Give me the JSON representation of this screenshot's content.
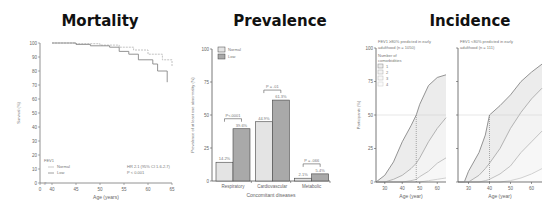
{
  "panels": {
    "mortality": {
      "title": "Mortality"
    },
    "prevalence": {
      "title": "Prevalence"
    },
    "incidence": {
      "title": "Incidence"
    }
  },
  "chart_data": [
    {
      "type": "line",
      "title": "Mortality",
      "xlabel": "Age (years)",
      "ylabel": "Survival (%)",
      "x_ticks": [
        "0",
        "40",
        "45",
        "50",
        "55",
        "60",
        "65"
      ],
      "y_ticks": [
        "0",
        "10",
        "20",
        "30",
        "40",
        "50",
        "60",
        "70",
        "80",
        "90",
        "100"
      ],
      "ylim": [
        0,
        100
      ],
      "xlim": [
        40,
        65
      ],
      "legend_title": "FEV1",
      "series": [
        {
          "name": "Normal",
          "x": [
            40,
            45,
            50,
            54,
            57,
            60,
            63,
            65
          ],
          "values": [
            100,
            99.5,
            98.5,
            97,
            95,
            92,
            88,
            83
          ]
        },
        {
          "name": "Low",
          "x": [
            40,
            45,
            48,
            52,
            54,
            56,
            58,
            61,
            62,
            64
          ],
          "values": [
            100,
            99,
            98,
            97,
            94,
            92,
            88,
            85,
            80,
            72
          ]
        }
      ],
      "annotations": [
        "HR 2.1 (95% CI 1.6-2.7)",
        "P < 0.001"
      ]
    },
    {
      "type": "bar",
      "title": "Prevalence",
      "xlabel": "Concomitant diseases",
      "ylabel": "Prevalence of at least one abnormality (%)",
      "categories": [
        "Respiratory",
        "Cardiovascular",
        "Metabolic"
      ],
      "series": [
        {
          "name": "Normal",
          "values": [
            14.2,
            44.9,
            2.1
          ],
          "color": "#e4e4e4"
        },
        {
          "name": "Low",
          "values": [
            39.6,
            61.3,
            5.4
          ],
          "color": "#a9a9a9"
        }
      ],
      "value_labels": {
        "Normal": [
          "14.2%",
          "44.9%",
          "2.1%"
        ],
        "Low": [
          "39.6%",
          "61.3%",
          "5.4%"
        ]
      },
      "p_values": [
        "P<.0001",
        "P = .01",
        "P = .066"
      ],
      "y_ticks": [
        "0",
        "25",
        "50",
        "75",
        "100"
      ],
      "ylim": [
        0,
        100
      ],
      "legend_position": "top-left"
    },
    {
      "type": "area",
      "title": "FEV1 ≥80% predicted in early adulthood (n = 1050)",
      "xlabel": "Age (year)",
      "ylabel": "Participants (%)",
      "x_ticks": [
        "30",
        "40",
        "50",
        "60"
      ],
      "y_ticks": [
        "0",
        "25",
        "50",
        "75",
        "100"
      ],
      "ylim": [
        0,
        100
      ],
      "xlim": [
        25,
        65
      ],
      "legend_title": "Number of comorbidities",
      "x": [
        25,
        30,
        35,
        40,
        45,
        48,
        50,
        55,
        60,
        65
      ],
      "series": [
        {
          "name": "1",
          "values": [
            0,
            5,
            15,
            30,
            42,
            50,
            58,
            72,
            78,
            80
          ]
        },
        {
          "name": "2",
          "values": [
            0,
            0,
            2,
            5,
            10,
            14,
            18,
            30,
            40,
            48
          ]
        },
        {
          "name": "3",
          "values": [
            0,
            0,
            0,
            0,
            1,
            2,
            4,
            8,
            14,
            18
          ]
        },
        {
          "name": "4",
          "values": [
            0,
            0,
            0,
            0,
            0,
            0,
            0,
            1,
            2,
            3
          ]
        }
      ],
      "reference_line": {
        "x": 48,
        "y": 50
      }
    },
    {
      "type": "area",
      "title": "FEV1 <80% predicted in early adulthood (n = 111)",
      "xlabel": "Age (year)",
      "ylabel": "",
      "x_ticks": [
        "30",
        "40",
        "50",
        "60"
      ],
      "ylim": [
        0,
        100
      ],
      "xlim": [
        25,
        65
      ],
      "x": [
        25,
        28,
        30,
        35,
        38,
        40,
        45,
        50,
        55,
        60,
        65
      ],
      "series": [
        {
          "name": "1",
          "values": [
            0,
            0,
            8,
            22,
            35,
            50,
            57,
            65,
            75,
            82,
            88
          ]
        },
        {
          "name": "2",
          "values": [
            0,
            0,
            0,
            5,
            10,
            14,
            25,
            40,
            52,
            62,
            70
          ]
        },
        {
          "name": "3",
          "values": [
            0,
            0,
            0,
            0,
            1,
            2,
            6,
            12,
            22,
            30,
            38
          ]
        },
        {
          "name": "4",
          "values": [
            0,
            0,
            0,
            0,
            0,
            0,
            0,
            1,
            3,
            6,
            10
          ]
        }
      ],
      "reference_line": {
        "x": 40,
        "y": 50
      }
    }
  ]
}
